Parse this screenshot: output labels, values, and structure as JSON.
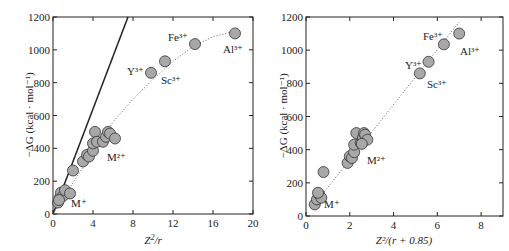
{
  "chart_data": [
    {
      "type": "scatter",
      "title": "",
      "xlabel": "Z²/r",
      "ylabel": "−ΔG (kcal · mol⁻¹)",
      "xlim": [
        0,
        20
      ],
      "ylim": [
        0,
        1200
      ],
      "xticks": [
        0,
        4,
        8,
        12,
        16,
        20
      ],
      "yticks": [
        0,
        200,
        400,
        600,
        800,
        1000,
        1200
      ],
      "grid": false,
      "points": [
        {
          "x": 0.5,
          "y": 70
        },
        {
          "x": 0.7,
          "y": 100
        },
        {
          "x": 0.8,
          "y": 130
        },
        {
          "x": 1.0,
          "y": 110
        },
        {
          "x": 1.2,
          "y": 145
        },
        {
          "x": 1.7,
          "y": 125
        },
        {
          "x": 0.6,
          "y": 85
        },
        {
          "x": 2.0,
          "y": 265
        },
        {
          "x": 3.0,
          "y": 320
        },
        {
          "x": 3.4,
          "y": 360
        },
        {
          "x": 3.6,
          "y": 350
        },
        {
          "x": 4.0,
          "y": 385
        },
        {
          "x": 4.0,
          "y": 430
        },
        {
          "x": 4.2,
          "y": 500
        },
        {
          "x": 4.4,
          "y": 440
        },
        {
          "x": 5.0,
          "y": 440
        },
        {
          "x": 5.3,
          "y": 470
        },
        {
          "x": 5.5,
          "y": 500
        },
        {
          "x": 5.7,
          "y": 490
        },
        {
          "x": 6.2,
          "y": 460
        },
        {
          "x": 9.8,
          "y": 860,
          "label": "Y³⁺"
        },
        {
          "x": 11.2,
          "y": 930,
          "label": "Sc³⁺"
        },
        {
          "x": 14.2,
          "y": 1035,
          "label": "Fe³⁺"
        },
        {
          "x": 18.2,
          "y": 1100,
          "label": "Al³⁺"
        }
      ],
      "annotations": [
        "M⁺",
        "M²⁺",
        "Y³⁺",
        "Sc³⁺",
        "Fe³⁺",
        "Al³⁺"
      ],
      "lines": [
        {
          "style": "solid",
          "from": [
            0,
            0
          ],
          "to": [
            7.5,
            1200
          ]
        },
        {
          "style": "dotted-curve",
          "points": [
            [
              0,
              0
            ],
            [
              2,
              190
            ],
            [
              4,
              380
            ],
            [
              6,
              560
            ],
            [
              8,
              700
            ],
            [
              10,
              820
            ],
            [
              12,
              930
            ],
            [
              14,
              1020
            ],
            [
              16,
              1080
            ],
            [
              18,
              1110
            ]
          ]
        }
      ]
    },
    {
      "type": "scatter",
      "title": "",
      "xlabel": "Z²/(r + 0.85)",
      "ylabel": "−ΔG (kcal · mol⁻¹)",
      "xlim": [
        0,
        9
      ],
      "ylim": [
        0,
        1200
      ],
      "xticks": [
        0,
        2,
        4,
        6,
        8
      ],
      "yticks": [
        0,
        200,
        400,
        600,
        800,
        1000,
        1200
      ],
      "grid": false,
      "points": [
        {
          "x": 0.4,
          "y": 70
        },
        {
          "x": 0.5,
          "y": 100
        },
        {
          "x": 0.6,
          "y": 130
        },
        {
          "x": 0.7,
          "y": 110
        },
        {
          "x": 0.55,
          "y": 140
        },
        {
          "x": 0.8,
          "y": 265
        },
        {
          "x": 1.9,
          "y": 320
        },
        {
          "x": 2.0,
          "y": 360
        },
        {
          "x": 2.1,
          "y": 350
        },
        {
          "x": 2.2,
          "y": 385
        },
        {
          "x": 2.2,
          "y": 430
        },
        {
          "x": 2.3,
          "y": 500
        },
        {
          "x": 2.5,
          "y": 440
        },
        {
          "x": 2.6,
          "y": 470
        },
        {
          "x": 2.65,
          "y": 500
        },
        {
          "x": 2.7,
          "y": 490
        },
        {
          "x": 2.8,
          "y": 460
        },
        {
          "x": 2.55,
          "y": 435
        },
        {
          "x": 5.2,
          "y": 860,
          "label": "Sc³⁺"
        },
        {
          "x": 5.6,
          "y": 930,
          "label": "Y³⁺"
        },
        {
          "x": 6.3,
          "y": 1035,
          "label": "Fe³⁺"
        },
        {
          "x": 7.0,
          "y": 1100,
          "label": "Al³⁺"
        }
      ],
      "annotations": [
        "M⁺",
        "M²⁺",
        "Y³⁺",
        "Sc³⁺",
        "Fe³⁺",
        "Al³⁺"
      ],
      "lines": [
        {
          "style": "dotted",
          "from": [
            0.5,
            90
          ],
          "to": [
            7.0,
            1170
          ]
        }
      ]
    }
  ],
  "left": {
    "xlabel_main": "Z",
    "xlabel_sup": "2",
    "xlabel_rest": "/r",
    "ylabel": "−ΔG (kcal · mol⁻¹)",
    "xticks": [
      "0",
      "4",
      "8",
      "12",
      "16",
      "20"
    ],
    "yticks": [
      "0",
      "200",
      "400",
      "600",
      "800",
      "1000",
      "1200"
    ],
    "labels": {
      "mplus": "M⁺",
      "m2plus": "M²⁺",
      "y3": "Y³⁺",
      "sc3": "Sc³⁺",
      "fe3": "Fe³⁺",
      "al3": "Al³⁺"
    }
  },
  "right": {
    "xlabel": "Z²/(r + 0.85)",
    "ylabel": "−ΔG (kcal · mol⁻¹)",
    "xticks": [
      "0",
      "2",
      "4",
      "6",
      "8"
    ],
    "yticks": [
      "0",
      "200",
      "400",
      "600",
      "800",
      "1000",
      "1200"
    ],
    "labels": {
      "mplus": "M⁺",
      "m2plus": "M²⁺",
      "y3": "Y³⁺",
      "sc3": "Sc³⁺",
      "fe3": "Fe³⁺",
      "al3": "Al³⁺"
    }
  }
}
